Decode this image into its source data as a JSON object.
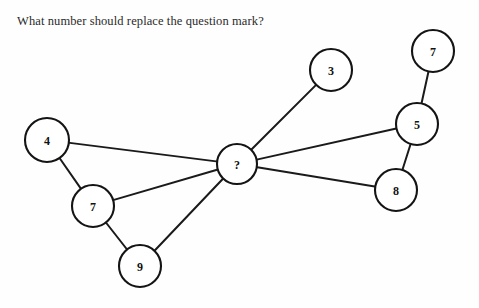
{
  "page": {
    "title": "What number should replace the question mark?",
    "background_color": "#fefefe",
    "width": 479,
    "height": 308
  },
  "graph": {
    "node_stroke_color": "#141414",
    "node_fill_color": "#ffffff",
    "edge_color": "#1a1a1a",
    "nodes": [
      {
        "id": "n4",
        "label": "4",
        "cx": 47,
        "cy": 140,
        "r": 22
      },
      {
        "id": "n7left",
        "label": "7",
        "cx": 93,
        "cy": 206,
        "r": 21
      },
      {
        "id": "n9",
        "label": "9",
        "cx": 140,
        "cy": 266,
        "r": 21
      },
      {
        "id": "ncenter",
        "label": "?",
        "cx": 237,
        "cy": 164,
        "r": 20
      },
      {
        "id": "n3",
        "label": "3",
        "cx": 331,
        "cy": 70,
        "r": 21
      },
      {
        "id": "n7top",
        "label": "7",
        "cx": 433,
        "cy": 51,
        "r": 21
      },
      {
        "id": "n5",
        "label": "5",
        "cx": 417,
        "cy": 124,
        "r": 21
      },
      {
        "id": "n8",
        "label": "8",
        "cx": 396,
        "cy": 190,
        "r": 21
      }
    ],
    "edges": [
      {
        "from": "n4",
        "to": "n7left"
      },
      {
        "from": "n4",
        "to": "ncenter"
      },
      {
        "from": "n7left",
        "to": "n9"
      },
      {
        "from": "n7left",
        "to": "ncenter"
      },
      {
        "from": "n9",
        "to": "ncenter"
      },
      {
        "from": "ncenter",
        "to": "n3"
      },
      {
        "from": "ncenter",
        "to": "n5"
      },
      {
        "from": "ncenter",
        "to": "n8"
      },
      {
        "from": "n7top",
        "to": "n5"
      },
      {
        "from": "n5",
        "to": "n8"
      }
    ]
  },
  "chart_data": {
    "type": "diagram",
    "title": "What number should replace the question mark?",
    "node_values": [
      "4",
      "7",
      "9",
      "?",
      "3",
      "7",
      "5",
      "8"
    ],
    "edge_list": [
      [
        "4",
        "7"
      ],
      [
        "4",
        "?"
      ],
      [
        "7",
        "9"
      ],
      [
        "7",
        "?"
      ],
      [
        "9",
        "?"
      ],
      [
        "?",
        "3"
      ],
      [
        "?",
        "5"
      ],
      [
        "?",
        "8"
      ],
      [
        "7",
        "5"
      ],
      [
        "5",
        "8"
      ]
    ]
  }
}
